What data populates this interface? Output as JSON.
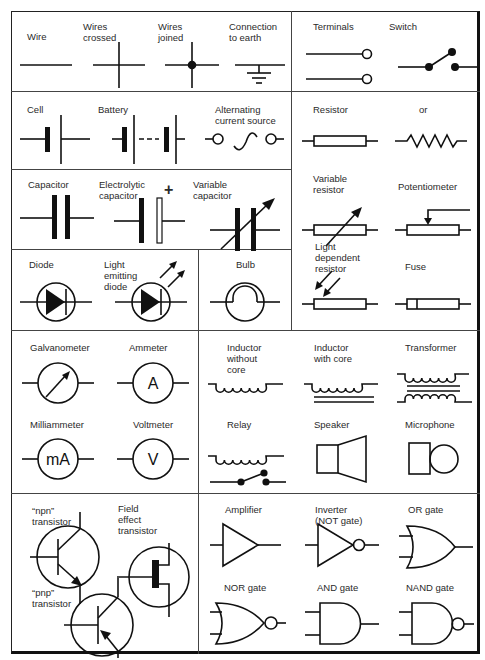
{
  "sections": {
    "wires": {
      "wire": "Wire",
      "wires_crossed": "Wires\ncrossed",
      "wires_joined": "Wires\njoined",
      "earth": "Connection\nto earth"
    },
    "switches": {
      "terminals": "Terminals",
      "switch": "Switch"
    },
    "sources": {
      "cell": "Cell",
      "battery": "Battery",
      "ac_source": "Alternating\ncurrent source"
    },
    "capacitors": {
      "capacitor": "Capacitor",
      "electrolytic": "Electrolytic\ncapacitor",
      "electrolytic_plus": "+",
      "variable": "Variable\ncapacitor"
    },
    "resistors": {
      "resistor": "Resistor",
      "or": "or",
      "variable_resistor": "Variable\nresistor",
      "potentiometer": "Potentiometer",
      "ldr": "Light\ndependent\nresistor",
      "fuse": "Fuse"
    },
    "diodes": {
      "diode": "Diode",
      "led": "Light\nemitting\ndiode"
    },
    "bulb": {
      "bulb": "Bulb"
    },
    "meters": {
      "galvanometer": "Galvanometer",
      "ammeter": "Ammeter",
      "ammeter_glyph": "A",
      "milliammeter": "Milliammeter",
      "milliammeter_glyph": "mA",
      "voltmeter": "Voltmeter",
      "voltmeter_glyph": "V"
    },
    "coils": {
      "inductor_no_core": "Inductor\nwithout\ncore",
      "inductor_core": "Inductor\nwith core",
      "transformer": "Transformer",
      "relay": "Relay",
      "speaker": "Speaker",
      "microphone": "Microphone"
    },
    "transistors": {
      "npn": "“npn”\ntransistor",
      "fet": "Field\neffect\ntransistor",
      "pnp": "“pnp”\ntransistor"
    },
    "logic": {
      "amplifier": "Amplifier",
      "inverter": "Inverter\n(NOT gate)",
      "or_gate": "OR gate",
      "nor_gate": "NOR gate",
      "and_gate": "AND gate",
      "nand_gate": "NAND gate"
    }
  },
  "colors": {
    "line": "#111111",
    "background": "#ffffff",
    "text": "#2a2a2a"
  }
}
